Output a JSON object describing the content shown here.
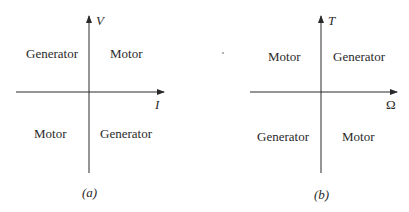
{
  "diagrams": [
    {
      "id": "a",
      "caption": "(a)",
      "axes": {
        "vertical_label": "V",
        "horizontal_label": "I"
      },
      "quadrants": {
        "top_left": "Generator",
        "top_right": "Motor",
        "bottom_left": "Motor",
        "bottom_right": "Generator"
      }
    },
    {
      "id": "b",
      "caption": "(b)",
      "axes": {
        "vertical_label": "T",
        "horizontal_label": "Ω"
      },
      "quadrants": {
        "top_left": "Motor",
        "top_right": "Generator",
        "bottom_left": "Generator",
        "bottom_right": "Motor"
      }
    }
  ],
  "colors": {
    "line": "#2a2a2a",
    "text": "#2a2a2a",
    "background": "#ffffff"
  }
}
